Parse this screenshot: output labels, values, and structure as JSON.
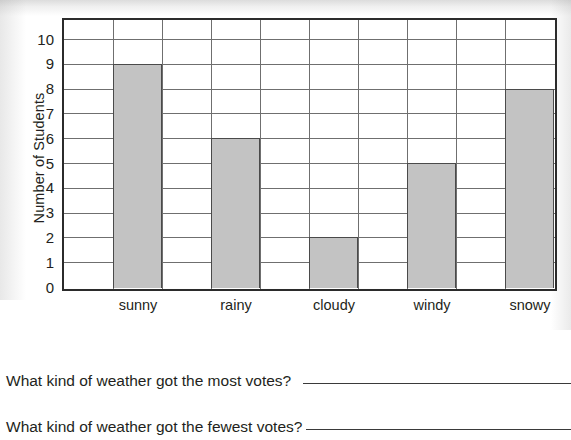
{
  "chart_data": {
    "type": "bar",
    "title": "",
    "xlabel": "",
    "ylabel": "Number of Students",
    "categories": [
      "sunny",
      "rainy",
      "cloudy",
      "windy",
      "snowy"
    ],
    "values": [
      9,
      6,
      2,
      5,
      8
    ],
    "ylim": [
      0,
      10
    ],
    "ytick_labels": [
      "10",
      "9",
      "8",
      "7",
      "6",
      "5",
      "4",
      "3",
      "2",
      "1",
      "0"
    ],
    "ytick_values": [
      10,
      9,
      8,
      7,
      6,
      5,
      4,
      3,
      2,
      1,
      0
    ],
    "grid": "horizontal-and-vertical",
    "legend": "none",
    "bar_fill_color": "#c3c3c3",
    "bar_border_color": "#4a4a4a",
    "grid_color": "#6f6f6f",
    "frame_color": "#2b2b2b"
  },
  "questions": [
    {
      "text": "What kind of weather got the most votes?",
      "answer": ""
    },
    {
      "text": "What kind of weather got the fewest votes?",
      "answer": ""
    }
  ]
}
